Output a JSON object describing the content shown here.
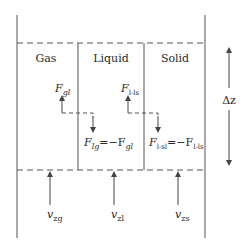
{
  "diagram": {
    "phases": [
      {
        "label": "Gas"
      },
      {
        "label": "Liquid"
      },
      {
        "label": "Solid"
      }
    ],
    "forces": {
      "f_gl": {
        "base": "F",
        "sub": "gl"
      },
      "f_l_ls": {
        "base": "F",
        "sub": "l-ls"
      },
      "f_lg": {
        "base": "F",
        "sub": "lg",
        "eq": "=−F",
        "eq_sub": "gl"
      },
      "f_l_sl": {
        "base": "F",
        "sub": "l-sl",
        "eq": "=−F",
        "eq_sub": "l-ls"
      }
    },
    "velocities": [
      {
        "base": "v",
        "sub": "zg"
      },
      {
        "base": "v",
        "sub": "zl"
      },
      {
        "base": "v",
        "sub": "zs"
      }
    ],
    "delta_z": "Δz",
    "colors": {
      "line": "#555555",
      "text": "#2a2a2a"
    }
  }
}
